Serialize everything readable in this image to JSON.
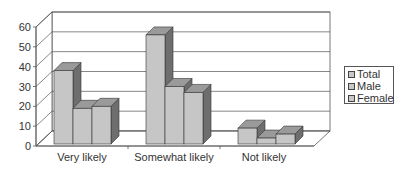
{
  "chart_data": {
    "type": "bar",
    "style": "3d-clustered-column",
    "title": "",
    "xlabel": "",
    "ylabel": "",
    "categories": [
      "Very likely",
      "Somewhat likely",
      "Not likely"
    ],
    "series": [
      {
        "name": "Total",
        "values": [
          37,
          55,
          8
        ]
      },
      {
        "name": "Male",
        "values": [
          18,
          29,
          3
        ]
      },
      {
        "name": "Female",
        "values": [
          19,
          26,
          5
        ]
      }
    ],
    "yticks": [
      0,
      10,
      20,
      30,
      40,
      50,
      60
    ],
    "ylim": [
      0,
      60
    ],
    "grid": true,
    "legend_position": "right",
    "colors": {
      "face": "#c6c6c6",
      "top": "#9a9a9a",
      "side": "#6e6e6e",
      "grid": "#555555"
    }
  },
  "legend": {
    "items": [
      "Total",
      "Male",
      "Female"
    ]
  }
}
